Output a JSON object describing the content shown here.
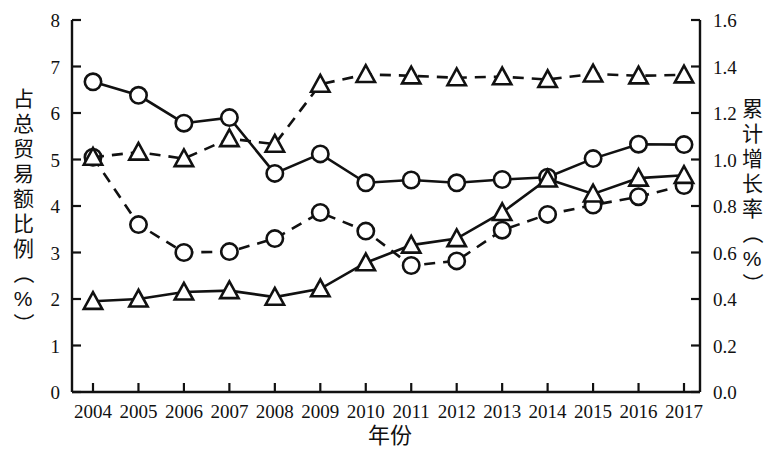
{
  "chart_data": {
    "type": "line",
    "title": "",
    "xlabel": "年份",
    "ylabel": "占总贸易额比例（%）",
    "y2label": "累计增长率（%）",
    "categories": [
      2004,
      2005,
      2006,
      2007,
      2008,
      2009,
      2010,
      2011,
      2012,
      2013,
      2014,
      2015,
      2016,
      2017
    ],
    "xlim": [
      2003.6,
      2017.4
    ],
    "ylim": [
      0,
      8
    ],
    "y2lim": [
      0.0,
      1.6
    ],
    "yticks": [
      0,
      1,
      2,
      3,
      4,
      5,
      6,
      7,
      8
    ],
    "y2ticks": [
      "0.0",
      "0.2",
      "0.4",
      "0.6",
      "0.8",
      "1.0",
      "1.2",
      "1.4",
      "1.6"
    ],
    "grid": false,
    "legend": "none",
    "series": [
      {
        "name": "solid-circle-series",
        "axis": "left",
        "marker": "circle",
        "line": "solid",
        "values": [
          6.67,
          6.38,
          5.78,
          5.9,
          4.7,
          5.12,
          4.5,
          4.56,
          4.5,
          4.57,
          4.62,
          5.02,
          5.33,
          5.32
        ]
      },
      {
        "name": "dashed-circle-series",
        "axis": "left",
        "marker": "circle",
        "line": "dashed",
        "values": [
          5.05,
          3.6,
          3.0,
          3.02,
          3.3,
          3.86,
          3.46,
          2.72,
          2.82,
          3.48,
          3.82,
          4.02,
          4.2,
          4.44
        ]
      },
      {
        "name": "solid-triangle-series",
        "axis": "left",
        "marker": "triangle",
        "line": "solid",
        "values": [
          1.95,
          2.0,
          2.15,
          2.18,
          2.04,
          2.22,
          2.78,
          3.16,
          3.3,
          3.86,
          4.58,
          4.26,
          4.6,
          4.66
        ]
      },
      {
        "name": "dashed-triangle-series",
        "axis": "left",
        "marker": "triangle",
        "line": "dashed",
        "values": [
          5.05,
          5.16,
          5.02,
          5.45,
          5.33,
          6.62,
          6.83,
          6.8,
          6.76,
          6.78,
          6.72,
          6.84,
          6.8,
          6.82
        ]
      }
    ],
    "series_right_axis_equivalent": [
      {
        "name": "dashed-triangle-series-right-values",
        "values": [
          1.01,
          1.03,
          1.0,
          1.09,
          1.07,
          1.32,
          1.37,
          1.36,
          1.35,
          1.36,
          1.34,
          1.37,
          1.36,
          1.36
        ]
      }
    ],
    "colors": {
      "line": "#111111",
      "marker_fill": "#ffffff",
      "axis": "#111111",
      "background": "#ffffff"
    }
  }
}
